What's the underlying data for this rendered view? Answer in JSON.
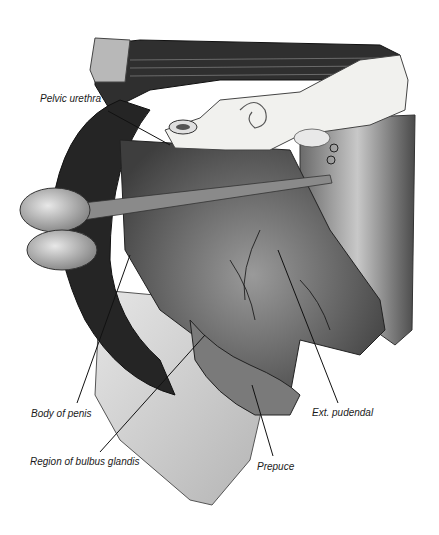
{
  "figure": {
    "style": "grayscale anatomical illustration",
    "colors": {
      "background": "#ffffff",
      "muscle_dark": "#2a2a2a",
      "muscle_mid": "#5a5a5a",
      "tissue_light": "#cfcfcf",
      "bone": "#f2f2f0",
      "skin": "#d8d8d8",
      "leader_line": "#111111",
      "label_text": "#1a1a1a"
    },
    "labels": [
      {
        "id": "pelvic-urethra",
        "text": "Pelvic urethra",
        "x": 40,
        "y": 99
      },
      {
        "id": "body-of-penis",
        "text": "Body of penis",
        "x": 31,
        "y": 408
      },
      {
        "id": "region-of-bulbus-glandis",
        "text": "Region of bulbus glandis",
        "x": 30,
        "y": 457
      },
      {
        "id": "ext-pudendal",
        "text": "Ext. pudendal",
        "x": 312,
        "y": 408
      },
      {
        "id": "prepuce",
        "text": "Prepuce",
        "x": 257,
        "y": 462
      }
    ]
  }
}
